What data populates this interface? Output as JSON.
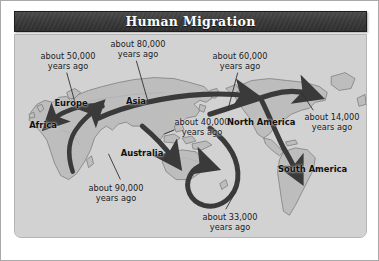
{
  "figure": {
    "title": "Human Migration",
    "colors": {
      "title_bar": "#3b3b3b",
      "panel_background": "#d2d2d2",
      "ocean": "#d2d2d2",
      "land": "#bdbdbd",
      "arrow": "#3a3a3a",
      "label_text": "#1a1a1a",
      "frame_border": "#a9a9a9"
    }
  },
  "map": {
    "migration_labels": [
      {
        "id": "europe-50k",
        "line1": "about 50,000",
        "line2": "years ago"
      },
      {
        "id": "central-asia-80k",
        "line1": "about 80,000",
        "line2": "years ago"
      },
      {
        "id": "siberia-60k",
        "line1": "about 60,000",
        "line2": "years ago"
      },
      {
        "id": "americas-14k",
        "line1": "about 14,000",
        "line2": "years ago"
      },
      {
        "id": "australia-40k",
        "line1": "about 40,000",
        "line2": "years ago"
      },
      {
        "id": "africa-90k",
        "line1": "about 90,000",
        "line2": "years ago"
      },
      {
        "id": "pacific-33k",
        "line1": "about 33,000",
        "line2": "years ago"
      }
    ],
    "place_labels": [
      {
        "id": "europe",
        "line1": "Europe",
        "line2": ""
      },
      {
        "id": "asia",
        "line1": "Asia",
        "line2": ""
      },
      {
        "id": "africa",
        "line1": "Africa",
        "line2": ""
      },
      {
        "id": "australia",
        "line1": "Australia",
        "line2": ""
      },
      {
        "id": "north-america",
        "line1": "North",
        "line2": "America"
      },
      {
        "id": "south-america",
        "line1": "South",
        "line2": "America"
      }
    ]
  }
}
